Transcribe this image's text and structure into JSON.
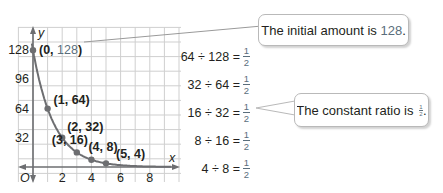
{
  "chart_data": {
    "type": "scatter",
    "title": "",
    "xlabel": "x",
    "ylabel": "y",
    "origin_label": "O",
    "x_ticks": [
      "2",
      "4",
      "6",
      "8"
    ],
    "y_ticks": [
      "32",
      "64",
      "96",
      "128"
    ],
    "xlim": [
      -0.3,
      9.5
    ],
    "ylim": [
      -24,
      144
    ],
    "grid": true,
    "curve": "exponential decay y = 128*(1/2)^x",
    "points": [
      {
        "x": 0,
        "y": 128,
        "label": "(0, 128)"
      },
      {
        "x": 1,
        "y": 64,
        "label": "(1, 64)"
      },
      {
        "x": 2,
        "y": 32,
        "label": "(2, 32)"
      },
      {
        "x": 3,
        "y": 16,
        "label": "(3, 16)"
      },
      {
        "x": 4,
        "y": 8,
        "label": "(4, 8)"
      },
      {
        "x": 5,
        "y": 4,
        "label": "(5, 4)"
      }
    ]
  },
  "equations": [
    {
      "lhs": "64 ÷ 128 =",
      "num": "1",
      "den": "2"
    },
    {
      "lhs": "32 ÷ 64 =",
      "num": "1",
      "den": "2"
    },
    {
      "lhs": "16 ÷ 32 =",
      "num": "1",
      "den": "2"
    },
    {
      "lhs": "8 ÷ 16 =",
      "num": "1",
      "den": "2"
    },
    {
      "lhs": "4 ÷ 8 =",
      "num": "1",
      "den": "2"
    }
  ],
  "callouts": {
    "initial": {
      "text": "The initial amount is ",
      "value": "128",
      "suffix": "."
    },
    "ratio": {
      "text": "The constant ratio is ",
      "num": "1",
      "den": "2",
      "suffix": "."
    }
  },
  "colors": {
    "grid": "#c8c8c8",
    "curve": "#6d6e71",
    "accent": "#5a6e7c"
  }
}
